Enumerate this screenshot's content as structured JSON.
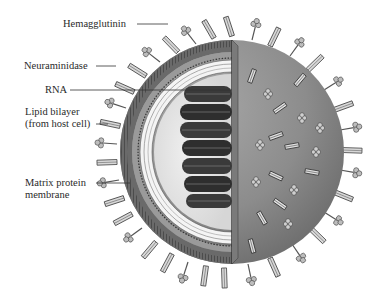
{
  "figure": {
    "colors": {
      "background": "#ffffff",
      "sphere_surface": "#8f8f8f",
      "sphere_shadow": "#6e6e6e",
      "interior": "#e6e6e6",
      "rna_coil": "#3a3a3a",
      "membrane": "#5a5a5a",
      "spike": "#b8b8b8",
      "label_text": "#2a2a2a"
    },
    "labels": [
      {
        "id": "hemagglutinin",
        "text": "Hemagglutinin"
      },
      {
        "id": "neuraminidase",
        "text": "Neuraminidase"
      },
      {
        "id": "rna",
        "text": "RNA"
      },
      {
        "id": "lipid_bilayer_1",
        "text": "Lipid bilayer"
      },
      {
        "id": "lipid_bilayer_2",
        "text": "(from host cell)"
      },
      {
        "id": "matrix_1",
        "text": "Matrix protein"
      },
      {
        "id": "matrix_2",
        "text": "membrane"
      }
    ]
  }
}
